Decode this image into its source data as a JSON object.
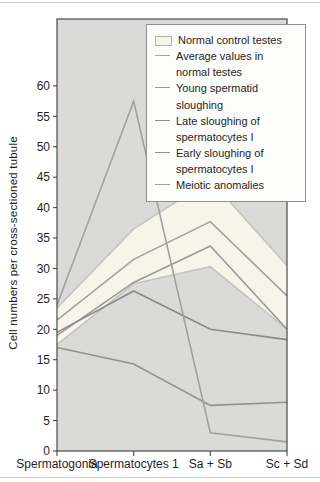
{
  "legend": {
    "items": [
      {
        "label": "Normal control testes",
        "swatch": "band",
        "color": "#f7f5ea",
        "border": "#b3b3ad"
      },
      {
        "label": "Average values in\nnormal testes",
        "swatch": "line",
        "color": "#a2a2a2"
      },
      {
        "label": "Young spermatid\nsloughing",
        "swatch": "line",
        "color": "#9a9a9a"
      },
      {
        "label": "Late sloughing of\nspermatocytes I",
        "swatch": "line",
        "color": "#8a8a8a"
      },
      {
        "label": "Early sloughing of\nspermatocytes I",
        "swatch": "line",
        "color": "#929292"
      },
      {
        "label": "Meiotic anomalies",
        "swatch": "line",
        "color": "#a0a09c"
      }
    ]
  },
  "chart_data": {
    "type": "line",
    "title": "",
    "xlabel": "",
    "ylabel": "Cell numbers per cross-sectioned tubule",
    "categories": [
      "Spermatogonia",
      "Spermatocytes 1",
      "Sa + Sb",
      "Sc + Sd"
    ],
    "ylim": [
      0,
      71
    ],
    "yticks": [
      0,
      5,
      10,
      15,
      20,
      25,
      30,
      35,
      40,
      45,
      50,
      55,
      60
    ],
    "grid": false,
    "legend_position": "top-right",
    "plot_bg": "#dadad8",
    "axis_color": "#4a4a4a",
    "band": {
      "name": "Normal control testes",
      "upper": [
        23.5,
        36.5,
        44.5,
        30.5
      ],
      "lower": [
        17.5,
        27.5,
        30.3,
        20
      ],
      "fill": "#f7f5ea",
      "edge": "#c4c4bf"
    },
    "series": [
      {
        "name": "Average values in normal testes",
        "values": [
          21.5,
          31.5,
          37.7,
          25.5
        ],
        "color": "#a2a2a2"
      },
      {
        "name": "Young spermatid sloughing",
        "values": [
          19,
          27.7,
          33.7,
          20
        ],
        "color": "#9a9a9a"
      },
      {
        "name": "Late sloughing of spermatocytes I",
        "values": [
          19.5,
          26.3,
          20,
          18.3
        ],
        "color": "#8a8a8a"
      },
      {
        "name": "Early sloughing of spermatocytes I",
        "values": [
          17,
          14.3,
          7.5,
          8
        ],
        "color": "#929292"
      },
      {
        "name": "Meiotic anomalies",
        "values": [
          24,
          57.5,
          3,
          1.5
        ],
        "color": "#a0a09c"
      }
    ]
  }
}
